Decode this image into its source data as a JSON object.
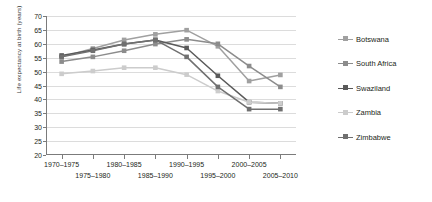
{
  "chart_data": {
    "type": "line",
    "title": "",
    "xlabel": "",
    "ylabel": "Life expectancy at birth (years)",
    "ylim": [
      20,
      70
    ],
    "ytick_values": [
      70,
      65,
      60,
      55,
      50,
      45,
      40,
      35,
      30,
      25,
      20
    ],
    "grid": true,
    "legend_position": "right",
    "categories": [
      "1970–1975",
      "1975–1980",
      "1980–1985",
      "1985–1990",
      "1990–1995",
      "1995–2000",
      "2000–2005",
      "2005–2010"
    ],
    "series": [
      {
        "name": "Botswana",
        "color": "#a0a0a0",
        "values": [
          55.3,
          58.3,
          61.4,
          63.4,
          64.9,
          59.1,
          46.6,
          48.8
        ]
      },
      {
        "name": "South Africa",
        "color": "#8c8c8c",
        "values": [
          53.6,
          55.3,
          57.5,
          59.9,
          61.6,
          60.0,
          52.0,
          44.5
        ]
      },
      {
        "name": "Swaziland",
        "color": "#5a5a5a",
        "values": [
          55.8,
          57.8,
          59.9,
          61.4,
          58.5,
          48.5,
          39.0,
          38.6
        ]
      },
      {
        "name": "Zambia",
        "color": "#cccccc",
        "values": [
          49.2,
          50.2,
          51.4,
          51.4,
          48.9,
          43.0,
          39.0,
          38.6
        ]
      },
      {
        "name": "Zimbabwe",
        "color": "#707070",
        "values": [
          55.3,
          57.5,
          59.9,
          61.4,
          55.3,
          44.5,
          36.5,
          36.5
        ]
      }
    ]
  },
  "legend": {
    "items": [
      {
        "label": "Botswana"
      },
      {
        "label": "South Africa"
      },
      {
        "label": "Swaziland"
      },
      {
        "label": "Zambia"
      },
      {
        "label": "Zimbabwe"
      }
    ]
  }
}
